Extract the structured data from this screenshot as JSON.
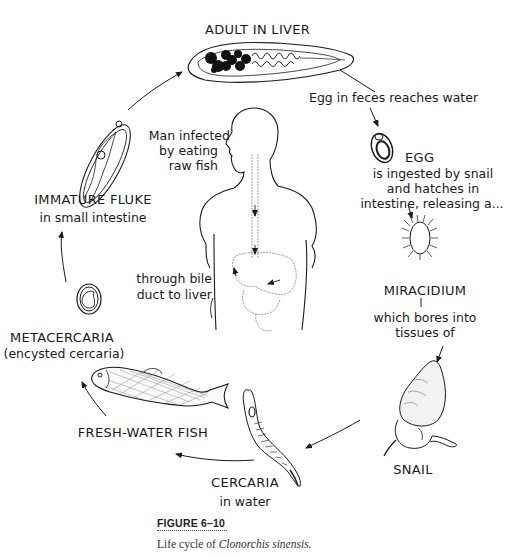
{
  "figure": {
    "number": "FIGURE 6–10",
    "caption_prefix": "Life cycle of ",
    "caption_species": "Clonorchis sinensis."
  },
  "stages": {
    "adult": {
      "title": "ADULT IN LIVER"
    },
    "egg_transition": {
      "text": "Egg in feces reaches water"
    },
    "egg": {
      "title": "EGG",
      "line1": "is ingested by snail",
      "line2": "and hatches in",
      "line3": "intestine, releasing a..."
    },
    "miracidium": {
      "title": "MIRACIDIUM",
      "line1": "which bores into",
      "line2": "tissues of"
    },
    "snail": {
      "title": "SNAIL"
    },
    "cercaria": {
      "title": "CERCARIA",
      "sub": "in water"
    },
    "fish": {
      "title": "FRESH-WATER FISH"
    },
    "metacercaria": {
      "title": "METACERCARIA",
      "sub": "(encysted cercaria)"
    },
    "immature": {
      "title": "IMMATURE FLUKE",
      "sub": "in small intestine"
    },
    "man": {
      "line1": "Man infected",
      "line2": "by eating",
      "line3": "raw fish"
    },
    "bile": {
      "line1": "through bile",
      "line2": "duct to liver"
    }
  },
  "cycle_order": [
    "ADULT IN LIVER",
    "EGG",
    "MIRACIDIUM",
    "SNAIL",
    "CERCARIA",
    "FRESH-WATER FISH",
    "METACERCARIA",
    "IMMATURE FLUKE"
  ]
}
